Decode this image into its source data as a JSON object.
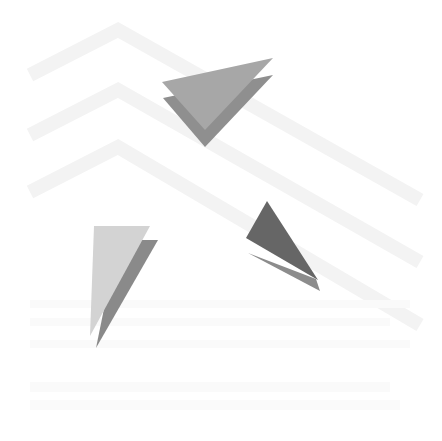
{
  "image": {
    "width": 442,
    "height": 441,
    "background": "#ffffff",
    "description": "Abstract composition: faint chevron stripes with grey paper-like triangles"
  },
  "stripes": {
    "color": "#f3f3f3",
    "width": 14,
    "chevrons": [
      {
        "points": "30,75 118,30 420,200"
      },
      {
        "points": "30,135 118,90 420,262"
      },
      {
        "points": "30,192 118,147 420,325"
      }
    ]
  },
  "shapes": [
    {
      "name": "top-triangle-back",
      "points": "163,98 273,75 205,147",
      "color": "#8f8f8f"
    },
    {
      "name": "top-triangle-front",
      "points": "162,82 273,58 205,130",
      "color": "#a7a7a7"
    },
    {
      "name": "left-triangle-back",
      "points": "118,240 158,240 96,348",
      "color": "#8a8a8a"
    },
    {
      "name": "left-triangle-front",
      "points": "94,226 150,226 90,336",
      "color": "#d3d3d3"
    },
    {
      "name": "right-triangle-shadow",
      "points": "248,253 316,279 320,291",
      "color": "#8c8c8c"
    },
    {
      "name": "right-triangle-front",
      "points": "267,201 318,280 246,238",
      "color": "#666666"
    }
  ]
}
